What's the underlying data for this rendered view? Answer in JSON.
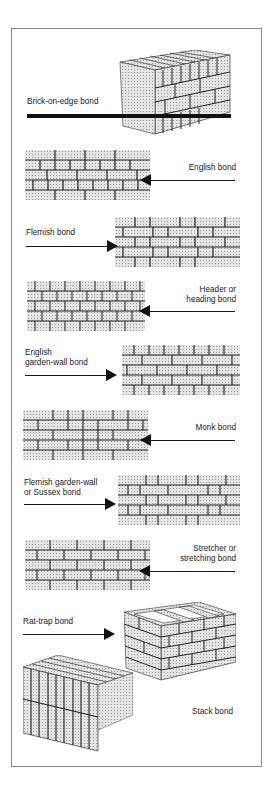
{
  "figure": {
    "colors": {
      "line": "#111111",
      "brick_fill": "#d8d8d8",
      "mortar": "#333333",
      "frame": "#8a8a8a"
    },
    "bonds": [
      {
        "id": "brick-on-edge",
        "label": "Brick-on-edge bond",
        "pointer": "thick-line",
        "side": "left"
      },
      {
        "id": "english",
        "label": "English bond",
        "pointer": "arrow-left",
        "side": "right"
      },
      {
        "id": "flemish",
        "label": "Flemish bond",
        "pointer": "arrow-right",
        "side": "left"
      },
      {
        "id": "header",
        "label": "Header or\nheading bond",
        "pointer": "arrow-left",
        "side": "right"
      },
      {
        "id": "english-garden-wall",
        "label": "English\ngarden-wall bond",
        "pointer": "arrow-right",
        "side": "left"
      },
      {
        "id": "monk",
        "label": "Monk bond",
        "pointer": "arrow-left",
        "side": "right"
      },
      {
        "id": "flemish-garden-wall",
        "label": "Flemish garden-wall\nor Sussex bond",
        "pointer": "arrow-right",
        "side": "left"
      },
      {
        "id": "stretcher",
        "label": "Stretcher or\nstretching bond",
        "pointer": "arrow-left",
        "side": "right"
      },
      {
        "id": "rat-trap",
        "label": "Rat-trap bond",
        "pointer": "arrow-right",
        "side": "left"
      },
      {
        "id": "stack",
        "label": "Stack bond",
        "pointer": "thick-line",
        "side": "right"
      }
    ]
  }
}
